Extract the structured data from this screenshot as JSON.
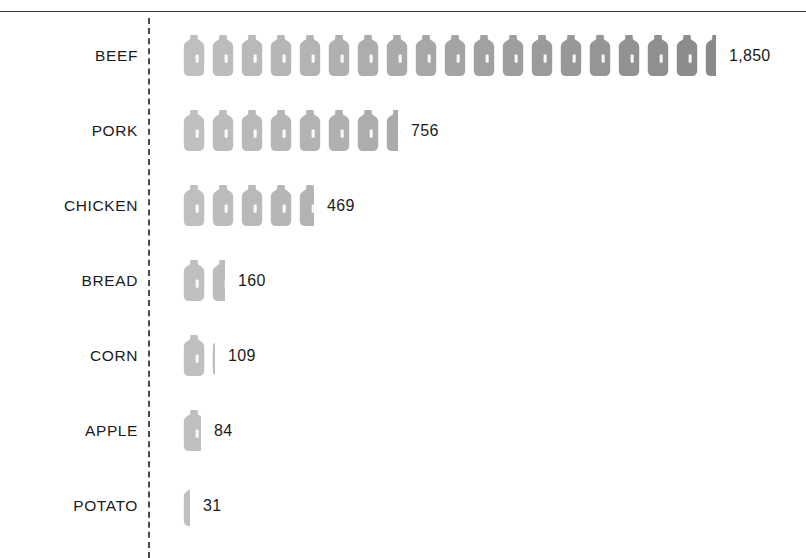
{
  "chart_data": {
    "type": "bar",
    "subtype": "pictogram",
    "title": "",
    "subtitle": "",
    "xlabel": "",
    "ylabel": "",
    "categories": [
      "BEEF",
      "PORK",
      "CHICKEN",
      "BREAD",
      "CORN",
      "APPLE",
      "POTATO"
    ],
    "values": [
      1850,
      756,
      469,
      160,
      109,
      84,
      31
    ],
    "value_labels": [
      "1,850",
      "756",
      "469",
      "160",
      "109",
      "84",
      "31"
    ],
    "icon": "water-jug-icon",
    "icon_unit_value": 100,
    "icon_counts": [
      18.5,
      7.56,
      4.69,
      1.6,
      1.09,
      0.84,
      0.31
    ],
    "orientation": "horizontal",
    "grid": false,
    "legend": false,
    "axis_style": "dashed-vertical",
    "value_label_position": "right-of-icons",
    "xlim": [
      0,
      1850
    ],
    "colors": {
      "icon_light": "#bdc0bd",
      "icon_dark": "#878a87",
      "axis": "#4a4a4a",
      "top_rule": "#3a3a3a",
      "label_text": "#1b1b1b",
      "background": "#ffffff"
    }
  },
  "rows": [
    {
      "label": "BEEF",
      "value_label": "1,850",
      "icons": 18.5
    },
    {
      "label": "PORK",
      "value_label": "756",
      "icons": 7.56
    },
    {
      "label": "CHICKEN",
      "value_label": "469",
      "icons": 4.69
    },
    {
      "label": "BREAD",
      "value_label": "160",
      "icons": 1.6
    },
    {
      "label": "CORN",
      "value_label": "109",
      "icons": 1.09
    },
    {
      "label": "APPLE",
      "value_label": "84",
      "icons": 0.84
    },
    {
      "label": "POTATO",
      "value_label": "31",
      "icons": 0.31
    }
  ]
}
